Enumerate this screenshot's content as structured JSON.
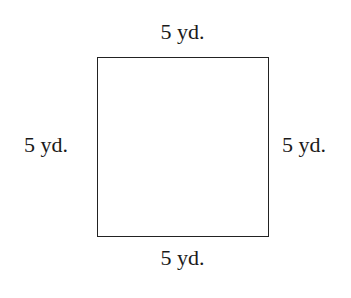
{
  "diagram": {
    "shape": "square",
    "labels": {
      "top": "5 yd.",
      "bottom": "5 yd.",
      "left": "5 yd.",
      "right": "5 yd."
    }
  }
}
